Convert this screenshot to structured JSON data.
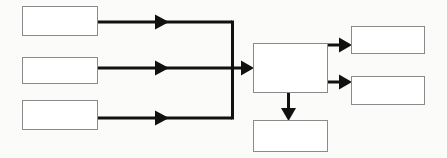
{
  "diagram": {
    "type": "flowchart",
    "orientation": "left-to-right",
    "canvas": {
      "width": 447,
      "height": 158
    },
    "style": {
      "background_color": "#fbfbfa",
      "box_fill_color": "#ffffff",
      "box_border_color": "#8a8a8a",
      "connector_color": "#111111",
      "connector_width": 3
    },
    "nodes": [
      {
        "id": "input-1",
        "label": "",
        "role": "input",
        "x": 22,
        "y": 6,
        "width": 76,
        "height": 30
      },
      {
        "id": "input-2",
        "label": "",
        "role": "input",
        "x": 22,
        "y": 57,
        "width": 76,
        "height": 27
      },
      {
        "id": "input-3",
        "label": "",
        "role": "input",
        "x": 22,
        "y": 100,
        "width": 76,
        "height": 30
      },
      {
        "id": "process",
        "label": "",
        "role": "process",
        "x": 253,
        "y": 43,
        "width": 75,
        "height": 50
      },
      {
        "id": "output-1",
        "label": "",
        "role": "output",
        "x": 351,
        "y": 26,
        "width": 74,
        "height": 28
      },
      {
        "id": "output-2",
        "label": "",
        "role": "output",
        "x": 351,
        "y": 76,
        "width": 74,
        "height": 29
      },
      {
        "id": "output-3",
        "label": "",
        "role": "output",
        "x": 253,
        "y": 120,
        "width": 75,
        "height": 32
      }
    ],
    "edges": [
      {
        "id": "edge-input-1",
        "from": "input-1",
        "to": "process",
        "label": "",
        "path": "elbow-down"
      },
      {
        "id": "edge-input-2",
        "from": "input-2",
        "to": "process",
        "label": "",
        "path": "straight"
      },
      {
        "id": "edge-input-3",
        "from": "input-3",
        "to": "process",
        "label": "",
        "path": "elbow-up"
      },
      {
        "id": "edge-output-1",
        "from": "process",
        "to": "output-1",
        "label": "",
        "path": "straight"
      },
      {
        "id": "edge-output-2",
        "from": "process",
        "to": "output-2",
        "label": "",
        "path": "straight"
      },
      {
        "id": "edge-output-3",
        "from": "process",
        "to": "output-3",
        "label": "",
        "path": "down"
      }
    ],
    "merge_trunk": {
      "x": 232,
      "top_y": 22,
      "bottom_y": 118,
      "note": "vertical bus joining the three input lines"
    }
  }
}
